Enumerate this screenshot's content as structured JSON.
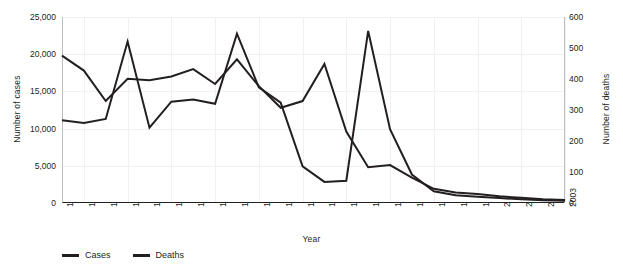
{
  "chart_data": {
    "type": "line",
    "title": "",
    "xlabel": "Year",
    "ylabel": "Number of cases",
    "y2label": "Number of deaths",
    "grid": true,
    "legend_position": "bottom-left",
    "categories": [
      "1980",
      "1981",
      "1982",
      "1983",
      "1984",
      "1985",
      "1986",
      "1987",
      "1988",
      "1989",
      "1990",
      "1991",
      "1992",
      "1993",
      "1994",
      "1995",
      "1996",
      "1997",
      "1998",
      "1999",
      "2000",
      "2001",
      "2002",
      "2003"
    ],
    "ylim": [
      0,
      25000
    ],
    "y2lim": [
      0,
      600
    ],
    "yticks": [
      "0",
      "5,000",
      "10,000",
      "15,000",
      "20,000",
      "25,000"
    ],
    "y2ticks": [
      "0",
      "100",
      "200",
      "300",
      "400",
      "500",
      "600"
    ],
    "series": [
      {
        "name": "Cases",
        "axis": "left",
        "color": "#231f20",
        "values": [
          19800,
          17800,
          13700,
          16700,
          16500,
          17000,
          18000,
          16000,
          19300,
          15700,
          12800,
          13700,
          18700,
          9600,
          4800,
          5100,
          3400,
          1900,
          1400,
          1200,
          900,
          700,
          500,
          400
        ]
      },
      {
        "name": "Deaths",
        "axis": "right",
        "color": "#231f20",
        "values": [
          267,
          258,
          271,
          521,
          243,
          327,
          334,
          320,
          546,
          373,
          324,
          118,
          68,
          72,
          555,
          238,
          92,
          38,
          25,
          20,
          16,
          12,
          9,
          7
        ]
      }
    ]
  },
  "legend": {
    "items": [
      {
        "label": "Cases"
      },
      {
        "label": "Deaths"
      }
    ]
  }
}
